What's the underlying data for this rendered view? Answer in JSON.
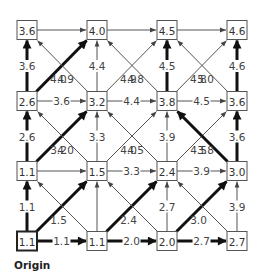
{
  "diagram": {
    "type": "lattice-grid-graph",
    "origin_label": "Origin",
    "grid": {
      "cols_x": [
        27,
        97,
        167,
        237
      ],
      "rows_y": [
        241,
        171,
        101,
        30
      ],
      "box_w": 20,
      "box_h": 19
    },
    "nodes": [
      {
        "id": "r0c0",
        "row": 0,
        "col": 0,
        "value": "1.1",
        "origin": true
      },
      {
        "id": "r0c1",
        "row": 0,
        "col": 1,
        "value": "1.1"
      },
      {
        "id": "r0c2",
        "row": 0,
        "col": 2,
        "value": "2.0"
      },
      {
        "id": "r0c3",
        "row": 0,
        "col": 3,
        "value": "2.7"
      },
      {
        "id": "r1c0",
        "row": 1,
        "col": 0,
        "value": "1.1"
      },
      {
        "id": "r1c1",
        "row": 1,
        "col": 1,
        "value": "1.5"
      },
      {
        "id": "r1c2",
        "row": 1,
        "col": 2,
        "value": "2.4"
      },
      {
        "id": "r1c3",
        "row": 1,
        "col": 3,
        "value": "3.0"
      },
      {
        "id": "r2c0",
        "row": 2,
        "col": 0,
        "value": "2.6"
      },
      {
        "id": "r2c1",
        "row": 2,
        "col": 1,
        "value": "3.2"
      },
      {
        "id": "r2c2",
        "row": 2,
        "col": 2,
        "value": "3.8"
      },
      {
        "id": "r2c3",
        "row": 2,
        "col": 3,
        "value": "3.6"
      },
      {
        "id": "r3c0",
        "row": 3,
        "col": 0,
        "value": "3.6"
      },
      {
        "id": "r3c1",
        "row": 3,
        "col": 1,
        "value": "4.0"
      },
      {
        "id": "r3c2",
        "row": 3,
        "col": 2,
        "value": "4.5"
      },
      {
        "id": "r3c3",
        "row": 3,
        "col": 3,
        "value": "4.6"
      }
    ],
    "edges": [
      {
        "from": "r0c0",
        "to": "r0c1",
        "label": "1.1",
        "thick": true
      },
      {
        "from": "r0c1",
        "to": "r0c2",
        "label": "2.0",
        "thick": true
      },
      {
        "from": "r0c2",
        "to": "r0c3",
        "label": "2.7",
        "thick": true
      },
      {
        "from": "r1c0",
        "to": "r1c1",
        "label": "",
        "thick": false
      },
      {
        "from": "r1c1",
        "to": "r1c2",
        "label": "3.3",
        "thick": false
      },
      {
        "from": "r1c2",
        "to": "r1c3",
        "label": "3.9",
        "thick": false
      },
      {
        "from": "r2c0",
        "to": "r2c1",
        "label": "3.6",
        "thick": false
      },
      {
        "from": "r2c1",
        "to": "r2c2",
        "label": "4.4",
        "thick": false
      },
      {
        "from": "r2c2",
        "to": "r2c3",
        "label": "4.5",
        "thick": false
      },
      {
        "from": "r3c0",
        "to": "r3c1",
        "label": "",
        "thick": false
      },
      {
        "from": "r3c1",
        "to": "r3c2",
        "label": "",
        "thick": false
      },
      {
        "from": "r3c2",
        "to": "r3c3",
        "label": "",
        "thick": false
      },
      {
        "from": "r0c0",
        "to": "r1c0",
        "label": "1.1",
        "thick": true
      },
      {
        "from": "r1c0",
        "to": "r2c0",
        "label": "2.6",
        "thick": true
      },
      {
        "from": "r2c0",
        "to": "r3c0",
        "label": "3.6",
        "thick": true
      },
      {
        "from": "r0c1",
        "to": "r1c1",
        "label": "",
        "thick": false
      },
      {
        "from": "r1c1",
        "to": "r2c1",
        "label": "3.3",
        "thick": false
      },
      {
        "from": "r2c1",
        "to": "r3c1",
        "label": "4.4",
        "thick": false
      },
      {
        "from": "r0c2",
        "to": "r1c2",
        "label": "2.7",
        "thick": false
      },
      {
        "from": "r1c2",
        "to": "r2c2",
        "label": "3.9",
        "thick": false
      },
      {
        "from": "r2c2",
        "to": "r3c2",
        "label": "4.5",
        "thick": true
      },
      {
        "from": "r0c3",
        "to": "r1c3",
        "label": "3.9",
        "thick": false
      },
      {
        "from": "r1c3",
        "to": "r2c3",
        "label": "3.6",
        "thick": true
      },
      {
        "from": "r2c3",
        "to": "r3c3",
        "label": "4.6",
        "thick": true
      },
      {
        "from": "r0c0",
        "to": "r1c1",
        "label": "1.5",
        "thick": true
      },
      {
        "from": "r0c1",
        "to": "r1c2",
        "label": "2.4",
        "thick": true
      },
      {
        "from": "r0c2",
        "to": "r1c3",
        "label": "3.0",
        "thick": true
      },
      {
        "from": "r1c0",
        "to": "r2c1",
        "label": "3.2",
        "thick": true
      },
      {
        "from": "r1c1",
        "to": "r2c2",
        "label": "4.0",
        "thick": false
      },
      {
        "from": "r1c2",
        "to": "r2c3",
        "label": "4.5",
        "thick": false
      },
      {
        "from": "r2c0",
        "to": "r3c1",
        "label": "4.0",
        "thick": true
      },
      {
        "from": "r2c1",
        "to": "r3c2",
        "label": "4.9",
        "thick": false
      },
      {
        "from": "r2c2",
        "to": "r3c3",
        "label": "4.8",
        "thick": false
      },
      {
        "from": "r0c1",
        "to": "r1c0",
        "label": "",
        "thick": false
      },
      {
        "from": "r0c2",
        "to": "r1c1",
        "label": "",
        "thick": false
      },
      {
        "from": "r0c3",
        "to": "r1c2",
        "label": "",
        "thick": false
      },
      {
        "from": "r1c1",
        "to": "r2c0",
        "label": "4.0",
        "thick": false
      },
      {
        "from": "r1c2",
        "to": "r2c1",
        "label": "4.5",
        "thick": false
      },
      {
        "from": "r1c3",
        "to": "r2c2",
        "label": "3.8",
        "thick": true
      },
      {
        "from": "r2c1",
        "to": "r3c0",
        "label": "4.9",
        "thick": false
      },
      {
        "from": "r2c2",
        "to": "r3c1",
        "label": "4.8",
        "thick": false
      },
      {
        "from": "r2c3",
        "to": "r3c2",
        "label": "5.0",
        "thick": false
      }
    ],
    "colors": {
      "thin_edge": "#555555",
      "thick_edge": "#111111",
      "node_border": "#555555",
      "text": "#333333",
      "background": "#ffffff"
    }
  }
}
